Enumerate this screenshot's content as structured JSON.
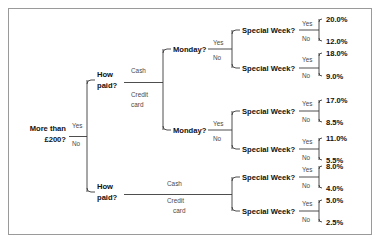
{
  "diagram": {
    "type": "decision-tree",
    "title": "",
    "root": {
      "label": "More than",
      "label_line2": "£200?",
      "branch_yes": "Yes",
      "branch_no": "No"
    },
    "nodes": {
      "how_paid_top_line1": "How",
      "how_paid_top_line2": "paid?",
      "how_paid_bottom_line1": "How",
      "how_paid_bottom_line2": "paid?",
      "cash_top": "Cash",
      "credit_top_line1": "Credit",
      "credit_top_line2": "card",
      "cash_bottom": "Cash",
      "credit_bottom_line1": "Credit",
      "credit_bottom_line2": "card",
      "monday_top": "Monday?",
      "monday_bottom": "Monday?",
      "special_week": "Special Week?",
      "yes": "Yes",
      "no": "No"
    },
    "leaves": [
      {
        "path": "Yes > Cash > Monday Yes > Special Yes",
        "value": "20.0%"
      },
      {
        "path": "Yes > Cash > Monday Yes > Special No",
        "value": "12.0%"
      },
      {
        "path": "Yes > Cash > Monday No > Special Yes",
        "value": "18.0%"
      },
      {
        "path": "Yes > Cash > Monday No > Special No",
        "value": "9.0%"
      },
      {
        "path": "Yes > Credit card > Monday Yes > Special Yes",
        "value": "17.0%"
      },
      {
        "path": "Yes > Credit card > Monday Yes > Special No",
        "value": "8.5%"
      },
      {
        "path": "Yes > Credit card > Monday No > Special Yes",
        "value": "11.0%"
      },
      {
        "path": "Yes > Credit card > Monday No > Special No",
        "value": "5.5%"
      },
      {
        "path": "No > Cash > Special Yes",
        "value": "8.0%"
      },
      {
        "path": "No > Cash > Special No",
        "value": "4.0%"
      },
      {
        "path": "No > Credit card > Special Yes",
        "value": "5.0%"
      },
      {
        "path": "No > Credit card > Special No",
        "value": "2.5%"
      }
    ],
    "colors": {
      "line": "#3a3a3a",
      "text": "#111111",
      "branch_text": "#4a4a4a",
      "frame": "#9a9a9a",
      "background": "#ffffff"
    }
  }
}
